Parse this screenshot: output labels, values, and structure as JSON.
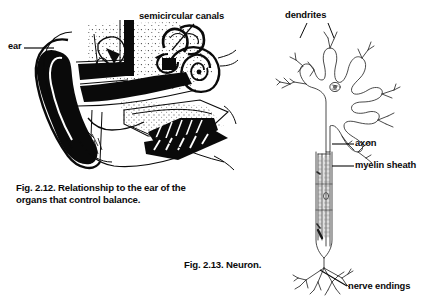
{
  "page": {
    "background_color": "#ffffff",
    "ink_color": "#0a0a0a",
    "width": 421,
    "height": 304
  },
  "figures": [
    {
      "id": "fig-2-12",
      "subject": "ear-cross-section",
      "caption_line_1": "Fig. 2.12. Relationship to the ear of the",
      "caption_line_2": "organs that control balance.",
      "labels": [
        {
          "name": "ear",
          "text": "ear"
        },
        {
          "name": "semicircular-canals",
          "text": "semicircular canals"
        }
      ]
    },
    {
      "id": "fig-2-13",
      "subject": "neuron",
      "caption_line_1": "Fig. 2.13. Neuron.",
      "labels": [
        {
          "name": "dendrites",
          "text": "dendrites"
        },
        {
          "name": "axon",
          "text": "axon"
        },
        {
          "name": "myelin-sheath",
          "text": "myelin sheath"
        },
        {
          "name": "nerve-endings",
          "text": "nerve endings"
        }
      ]
    }
  ],
  "fig212": {
    "label_ear": "ear",
    "label_semicircular_canals": "semicircular canals",
    "caption_1": "Fig. 2.12. Relationship to the ear of the",
    "caption_2": "organs that control balance."
  },
  "fig213": {
    "label_dendrites": "dendrites",
    "label_axon": "axon",
    "label_myelin_sheath": "myelin sheath",
    "label_nerve_endings": "nerve endings",
    "caption_1": "Fig. 2.13. Neuron."
  }
}
